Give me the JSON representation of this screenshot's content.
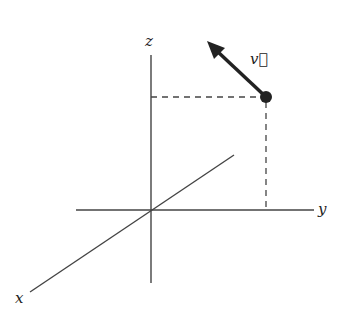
{
  "diagram": {
    "title": "",
    "axes": {
      "x": {
        "label": "x"
      },
      "y": {
        "label": "y"
      },
      "z": {
        "label": "z"
      }
    },
    "vector": {
      "label": "v⃗",
      "display": "v"
    },
    "colors": {
      "line": "#333333",
      "background": "#ffffff"
    }
  }
}
